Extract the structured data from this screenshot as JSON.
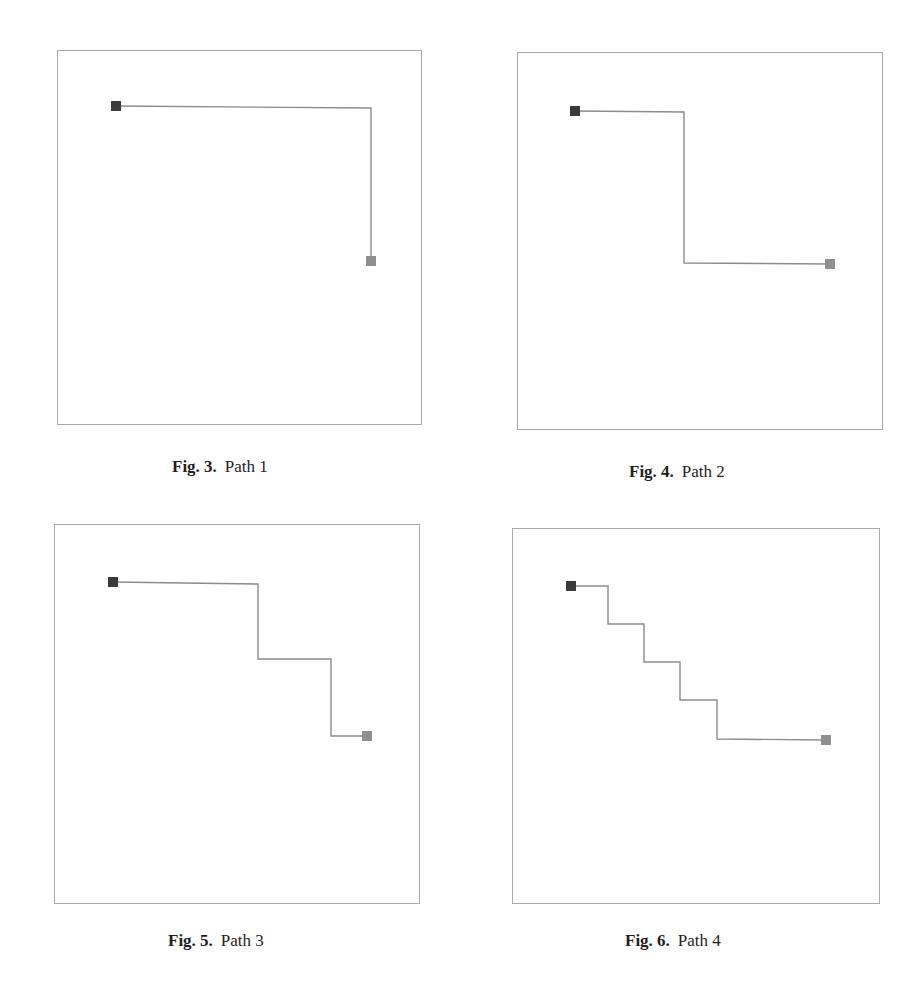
{
  "page": {
    "background": "#ffffff",
    "colors": {
      "panel_border": "#a8a8a8",
      "path_line": "#8c8c8c",
      "start_marker": "#3a3a3a",
      "end_marker": "#8f8f8f",
      "caption_text": "#1e1e1e"
    }
  },
  "figures": [
    {
      "id": "fig3",
      "label": "Fig. 3.",
      "title": "Path 1",
      "panel": {
        "x": 57,
        "y": 50,
        "w": 365,
        "h": 375
      },
      "caption_pos": {
        "x": 172,
        "y": 457
      },
      "points": [
        [
          58,
          55
        ],
        [
          313,
          57
        ],
        [
          313,
          210
        ]
      ]
    },
    {
      "id": "fig4",
      "label": "Fig. 4.",
      "title": "Path 2",
      "panel": {
        "x": 517,
        "y": 52,
        "w": 366,
        "h": 378
      },
      "caption_pos": {
        "x": 629,
        "y": 462
      },
      "points": [
        [
          57,
          58
        ],
        [
          166,
          59
        ],
        [
          166,
          210
        ],
        [
          312,
          211
        ]
      ]
    },
    {
      "id": "fig5",
      "label": "Fig. 5.",
      "title": "Path 3",
      "panel": {
        "x": 54,
        "y": 524,
        "w": 366,
        "h": 380
      },
      "caption_pos": {
        "x": 168,
        "y": 931
      },
      "points": [
        [
          58,
          57
        ],
        [
          203,
          59
        ],
        [
          203,
          134
        ],
        [
          276,
          134
        ],
        [
          276,
          211
        ],
        [
          312,
          211
        ]
      ]
    },
    {
      "id": "fig6",
      "label": "Fig. 6.",
      "title": "Path 4",
      "panel": {
        "x": 512,
        "y": 528,
        "w": 368,
        "h": 376
      },
      "caption_pos": {
        "x": 625,
        "y": 931
      },
      "points": [
        [
          58,
          57
        ],
        [
          95,
          57
        ],
        [
          95,
          95
        ],
        [
          131,
          95
        ],
        [
          131,
          133
        ],
        [
          167,
          133
        ],
        [
          167,
          171
        ],
        [
          204,
          171
        ],
        [
          204,
          210
        ],
        [
          313,
          211
        ]
      ]
    }
  ],
  "chart_data": [
    {
      "type": "line",
      "title": "Fig. 3. Path 1",
      "description": "Grid path from start (dark square) to goal (grey square) with a single turn",
      "x": [
        0,
        255,
        255
      ],
      "y": [
        0,
        0,
        155
      ],
      "segments": 2,
      "turns": 1,
      "grid": false,
      "legend": null
    },
    {
      "type": "line",
      "title": "Fig. 4. Path 2",
      "description": "Grid path with two turns",
      "x": [
        0,
        109,
        109,
        255
      ],
      "y": [
        0,
        0,
        152,
        152
      ],
      "segments": 3,
      "turns": 2,
      "grid": false,
      "legend": null
    },
    {
      "type": "line",
      "title": "Fig. 5. Path 3",
      "description": "Staircase grid path with four turns",
      "x": [
        0,
        145,
        145,
        218,
        218,
        254
      ],
      "y": [
        0,
        0,
        77,
        77,
        154,
        154
      ],
      "segments": 5,
      "turns": 4,
      "grid": false,
      "legend": null
    },
    {
      "type": "line",
      "title": "Fig. 6. Path 4",
      "description": "Staircase grid path with eight turns",
      "x": [
        0,
        37,
        37,
        73,
        73,
        109,
        109,
        146,
        146,
        255
      ],
      "y": [
        0,
        0,
        38,
        38,
        76,
        76,
        114,
        114,
        153,
        153
      ],
      "segments": 9,
      "turns": 8,
      "grid": false,
      "legend": null
    }
  ]
}
